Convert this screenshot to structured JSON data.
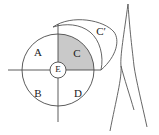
{
  "figure": {
    "background_color": "#ffffff",
    "stroke_color": "#4a4a4a",
    "shaded_region_color": "#c9c9c9",
    "labels": {
      "region_a": "A",
      "region_b": "B",
      "region_c": "C",
      "region_c_prime": "C′",
      "region_d": "D",
      "region_e": "E"
    },
    "geometry": {
      "main_circle": {
        "cx": 58,
        "cy": 70,
        "r": 36
      },
      "center_circle": {
        "cx": 58,
        "cy": 70,
        "r": 8
      },
      "horizontal_axis": {
        "x1": 8,
        "y1": 70,
        "x2": 100,
        "y2": 70
      },
      "vertical_axis": {
        "x1": 58,
        "y1": 24,
        "x2": 58,
        "y2": 122
      },
      "shaded_quadrant": "upper-right",
      "outer_arc_label": "C′",
      "right_curves_count": 3
    }
  }
}
